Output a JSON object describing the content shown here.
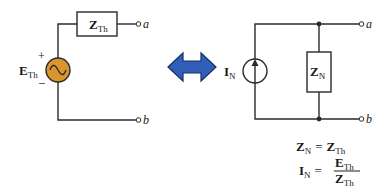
{
  "thevenin": {
    "impedance_label": "Z",
    "impedance_sub": "Th",
    "source_label": "E",
    "source_sub": "Th",
    "plus": "+",
    "minus": "−",
    "terminal_a": "a",
    "terminal_b": "b"
  },
  "norton": {
    "current_label": "I",
    "current_sub": "N",
    "impedance_label": "Z",
    "impedance_sub": "N",
    "terminal_a": "a",
    "terminal_b": "b"
  },
  "equations": {
    "eq1_lhs": "Z",
    "eq1_lhs_sub": "N",
    "eq1_eq": "=",
    "eq1_rhs": "Z",
    "eq1_rhs_sub": "Th",
    "eq2_lhs": "I",
    "eq2_lhs_sub": "N",
    "eq2_eq": "=",
    "eq2_num": "E",
    "eq2_num_sub": "Th",
    "eq2_den": "Z",
    "eq2_den_sub": "Th"
  },
  "colors": {
    "wire": "#2a2a2a",
    "source_fill": "#d9962e",
    "arrow_fill": "#2f5fb8",
    "arrow_stroke": "#1a2f66"
  }
}
